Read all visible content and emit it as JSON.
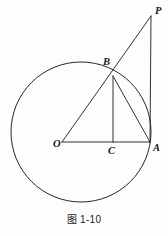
{
  "figure": {
    "caption": "图 1-10",
    "background_color": "#fdfdfd",
    "stroke_color": "#1c1c1c",
    "points": {
      "P": {
        "label": "P",
        "x": 151,
        "y": 16
      },
      "B": {
        "label": "B",
        "x": 113,
        "y": 76
      },
      "O": {
        "label": "O",
        "x": 62,
        "y": 142
      },
      "C": {
        "label": "C",
        "x": 113,
        "y": 142
      },
      "A": {
        "label": "A",
        "x": 150,
        "y": 142
      }
    },
    "circle": {
      "center_x": 81,
      "center_y": 132,
      "radius": 70
    },
    "segments": [
      {
        "name": "O-to-P",
        "from": "O",
        "to": "P"
      },
      {
        "name": "O-to-A",
        "from": "O",
        "to": "A"
      },
      {
        "name": "B-to-C",
        "from": "B",
        "to": "C"
      },
      {
        "name": "B-to-A",
        "from": "B",
        "to": "A"
      },
      {
        "name": "P-to-A",
        "from": "P",
        "to": "A"
      }
    ]
  }
}
